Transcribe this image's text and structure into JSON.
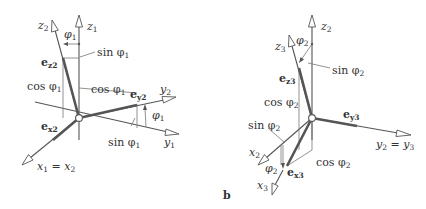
{
  "figure": {
    "panel_label_b": "b",
    "left": {
      "axes": {
        "z1": "z",
        "z1_sub": "1",
        "z2": "z",
        "z2_sub": "2",
        "y2": "y",
        "y2_sub": "2",
        "y1": "y",
        "y1_sub": "1",
        "x1x2": "x",
        "x1x2_sub1": "1",
        "x1x2_eq": " = x",
        "x1x2_sub2": "2"
      },
      "vectors": {
        "ez2": "e",
        "ez2_sub": "z2",
        "ey2": "e",
        "ey2_sub": "y2",
        "ex2": "e",
        "ex2_sub": "x2"
      },
      "annotations": {
        "phi1_top": "φ",
        "phi1_top_sub": "1",
        "sin_top": "sin φ",
        "sin_top_sub": "1",
        "cos_left": "cos φ",
        "cos_left_sub": "1",
        "cos_mid": "cos φ",
        "cos_mid_sub": "1",
        "phi1_right": "φ",
        "phi1_right_sub": "1",
        "sin_bottom": "sin φ",
        "sin_bottom_sub": "1"
      }
    },
    "right": {
      "axes": {
        "z2": "z",
        "z2_sub": "2",
        "z3": "z",
        "z3_sub": "3",
        "y2y3": "y",
        "y2y3_sub1": "2",
        "y2y3_eq": " = y",
        "y2y3_sub2": "3",
        "x2": "x",
        "x2_sub": "2",
        "x3": "x",
        "x3_sub": "3"
      },
      "vectors": {
        "ez3": "e",
        "ez3_sub": "z3",
        "ey3": "e",
        "ey3_sub": "y3",
        "ex3": "e",
        "ex3_sub": "x3"
      },
      "annotations": {
        "phi2_top": "φ",
        "phi2_top_sub": "2",
        "sin_top": "sin φ",
        "sin_top_sub": "2",
        "cos_left": "cos φ",
        "cos_left_sub": "2",
        "sin_left": "sin φ",
        "sin_left_sub": "2",
        "phi2_bottom": "φ",
        "phi2_bottom_sub": "2",
        "cos_bottom": "cos φ",
        "cos_bottom_sub": "2"
      }
    }
  }
}
